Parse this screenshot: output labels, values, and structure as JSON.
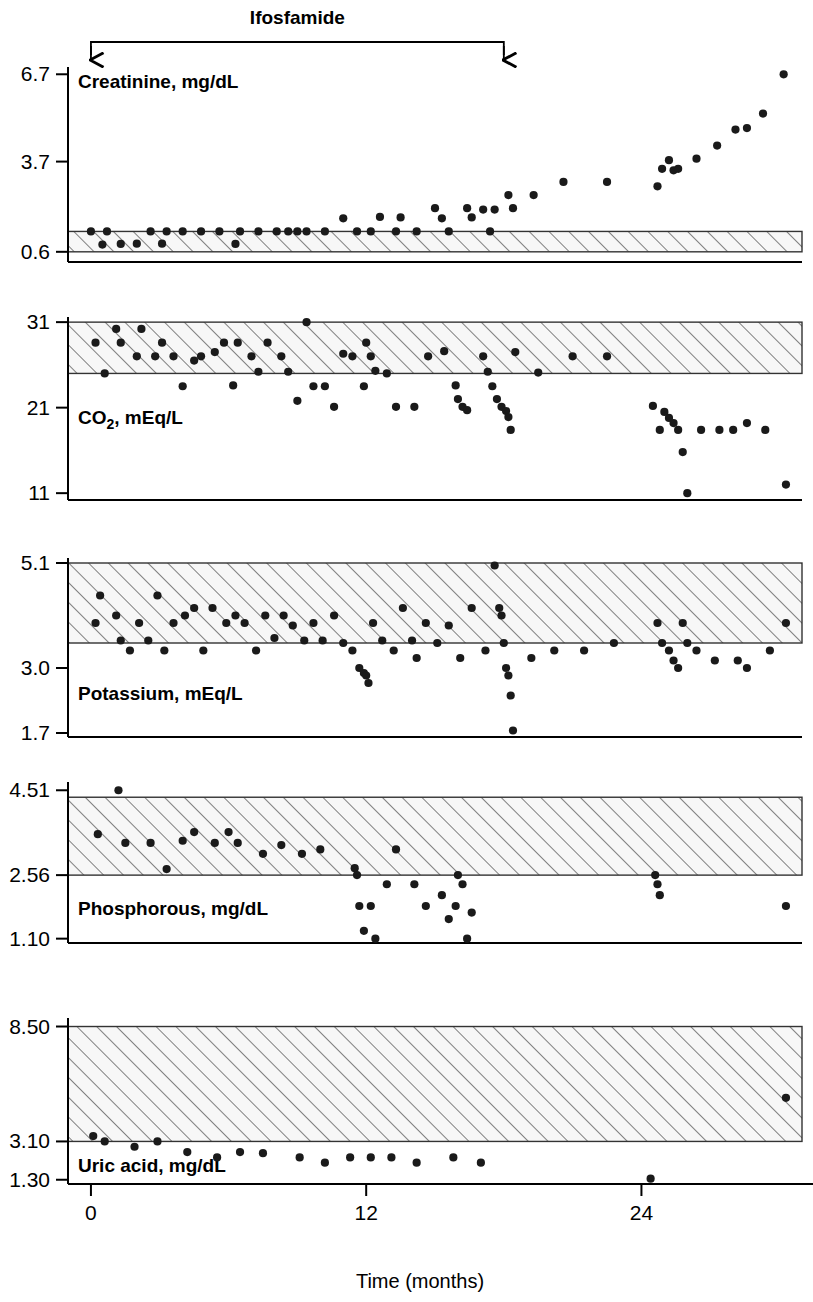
{
  "figure": {
    "title": "",
    "xaxis": {
      "label": "Time (months)",
      "ticks": [
        0,
        12,
        24
      ],
      "tick_labels": [
        "0",
        "12",
        "24"
      ],
      "range": [
        -1,
        31
      ]
    },
    "annotation": {
      "label": "Ifosfamide",
      "start_month": 0,
      "end_month": 18,
      "type": "bracket-with-arrows"
    },
    "marker_color": "#1a1a1a",
    "band_color": "#f2f2f2",
    "hatch_color": "#4d4d4d",
    "axis_color": "#000000"
  },
  "chart_data": [
    {
      "type": "scatter",
      "title": "Creatinine, mg/dL",
      "ylabel": "Creatinine, mg/dL",
      "xlabel": "Time (months)",
      "yticks": [
        0.6,
        3.7,
        6.7
      ],
      "ytick_labels": [
        "0.6",
        "3.7",
        "6.7"
      ],
      "ylim": [
        0.25,
        6.95
      ],
      "reference_band": [
        0.6,
        1.3
      ],
      "grid": false,
      "legend": "none",
      "x": [
        0.0,
        0.5,
        0.7,
        1.3,
        2.0,
        2.6,
        3.1,
        3.3,
        4.0,
        4.8,
        5.6,
        6.3,
        6.5,
        7.3,
        8.1,
        8.6,
        9.0,
        9.4,
        10.2,
        11.0,
        11.6,
        12.2,
        12.6,
        13.3,
        13.5,
        14.2,
        15.0,
        15.3,
        15.6,
        16.4,
        16.6,
        17.1,
        17.4,
        17.6,
        18.2,
        18.4,
        19.3,
        20.6,
        22.5,
        24.7,
        24.9,
        25.2,
        25.4,
        25.6,
        26.4,
        27.3,
        28.1,
        28.6,
        29.3,
        30.2
      ],
      "y": [
        1.3,
        0.85,
        1.3,
        0.87,
        0.88,
        1.3,
        0.88,
        1.3,
        1.3,
        1.3,
        1.3,
        0.87,
        1.3,
        1.3,
        1.3,
        1.3,
        1.3,
        1.3,
        1.3,
        1.75,
        1.3,
        1.3,
        1.8,
        1.3,
        1.78,
        1.3,
        2.1,
        1.75,
        1.3,
        2.1,
        1.78,
        2.05,
        1.3,
        2.05,
        2.55,
        2.1,
        2.55,
        3.0,
        3.0,
        2.85,
        3.45,
        3.75,
        3.4,
        3.45,
        3.8,
        4.25,
        4.8,
        4.85,
        5.35,
        6.7
      ]
    },
    {
      "type": "scatter",
      "title": "CO2, mEq/L",
      "ylabel": "CO2, mEq/L",
      "xlabel": "Time (months)",
      "yticks": [
        11,
        21,
        31
      ],
      "ytick_labels": [
        "11",
        "21",
        "31"
      ],
      "ylim": [
        10.2,
        31.6
      ],
      "reference_band": [
        25,
        31
      ],
      "grid": false,
      "legend": "none",
      "x": [
        0.2,
        0.6,
        1.1,
        1.3,
        2.0,
        2.2,
        2.8,
        3.1,
        3.6,
        4.0,
        4.5,
        4.8,
        5.4,
        5.8,
        6.2,
        6.4,
        7.0,
        7.3,
        7.7,
        8.3,
        8.6,
        9.0,
        9.4,
        9.7,
        10.2,
        10.6,
        11.0,
        11.4,
        11.9,
        12.0,
        12.2,
        12.4,
        12.9,
        13.3,
        14.1,
        14.7,
        15.4,
        15.9,
        16.0,
        16.2,
        16.4,
        17.1,
        17.3,
        17.5,
        17.7,
        17.9,
        18.1,
        18.2,
        18.3,
        18.5,
        19.5,
        21.0,
        22.5,
        24.5,
        24.8,
        25.0,
        25.2,
        25.4,
        25.6,
        25.8,
        26.0,
        26.6,
        27.4,
        28.0,
        28.6,
        29.4,
        30.3
      ],
      "y": [
        28.6,
        25.0,
        30.2,
        28.6,
        27.0,
        30.2,
        27.0,
        28.6,
        27.0,
        23.5,
        26.5,
        27.0,
        27.5,
        28.6,
        23.6,
        28.6,
        27.0,
        25.2,
        28.6,
        27.0,
        25.2,
        21.8,
        31.0,
        23.5,
        23.5,
        21.1,
        27.3,
        27.0,
        23.5,
        28.6,
        27.0,
        25.3,
        25.0,
        21.1,
        21.1,
        27.0,
        27.6,
        23.6,
        22.0,
        21.1,
        20.7,
        27.0,
        25.2,
        23.5,
        22.0,
        21.1,
        20.6,
        19.9,
        18.4,
        27.5,
        25.1,
        27.0,
        27.0,
        21.2,
        18.4,
        20.5,
        19.8,
        19.2,
        18.4,
        15.8,
        11.0,
        18.4,
        18.4,
        18.4,
        19.2,
        18.4,
        12.0
      ]
    },
    {
      "type": "scatter",
      "title": "Potassium, mEq/L",
      "ylabel": "Potassium, mEq/L",
      "xlabel": "Time (months)",
      "yticks": [
        1.7,
        3.0,
        5.1
      ],
      "ytick_labels": [
        "1.7",
        "3.0",
        "5.1"
      ],
      "ylim": [
        1.62,
        5.2
      ],
      "reference_band": [
        3.5,
        5.1
      ],
      "grid": false,
      "legend": "none",
      "x": [
        0.2,
        0.4,
        1.1,
        1.3,
        1.7,
        2.1,
        2.5,
        2.9,
        3.2,
        3.6,
        4.1,
        4.5,
        4.9,
        5.3,
        5.9,
        6.3,
        6.7,
        7.2,
        7.6,
        8.0,
        8.4,
        8.8,
        9.3,
        9.7,
        10.1,
        10.6,
        11.0,
        11.4,
        11.7,
        11.9,
        12.0,
        12.1,
        12.3,
        12.7,
        13.2,
        13.6,
        14.0,
        14.2,
        14.6,
        15.1,
        15.6,
        16.1,
        16.6,
        17.2,
        17.6,
        17.8,
        17.9,
        18.0,
        18.1,
        18.2,
        18.3,
        18.4,
        19.2,
        20.2,
        21.5,
        22.8,
        24.7,
        24.9,
        25.2,
        25.4,
        25.6,
        25.8,
        26.0,
        26.4,
        27.2,
        28.2,
        28.6,
        29.6,
        30.3
      ],
      "y": [
        3.9,
        4.45,
        4.05,
        3.55,
        3.35,
        3.9,
        3.55,
        4.45,
        3.35,
        3.9,
        4.05,
        4.2,
        3.35,
        4.2,
        3.9,
        4.05,
        3.9,
        3.35,
        4.05,
        3.6,
        4.05,
        3.85,
        3.55,
        3.9,
        3.55,
        4.05,
        3.5,
        3.35,
        3.0,
        2.9,
        2.85,
        2.7,
        3.9,
        3.55,
        3.35,
        4.2,
        3.55,
        3.2,
        3.9,
        3.5,
        3.85,
        3.2,
        4.2,
        3.35,
        5.05,
        4.2,
        4.05,
        3.5,
        3.0,
        2.85,
        2.45,
        1.75,
        3.2,
        3.35,
        3.35,
        3.5,
        3.9,
        3.5,
        3.35,
        3.15,
        3.0,
        3.9,
        3.5,
        3.35,
        3.15,
        3.15,
        3.0,
        3.35,
        3.9
      ]
    },
    {
      "type": "scatter",
      "title": "Phosphorous, mg/dL",
      "ylabel": "Phosphorous, mg/dL",
      "xlabel": "Time (months)",
      "yticks": [
        1.1,
        2.56,
        4.51
      ],
      "ytick_labels": [
        "1.10",
        "2.56",
        "4.51"
      ],
      "ylim": [
        1.0,
        4.7
      ],
      "reference_band": [
        2.56,
        4.35
      ],
      "grid": false,
      "legend": "none",
      "x": [
        0.3,
        1.2,
        1.5,
        2.6,
        3.3,
        4.0,
        4.5,
        5.4,
        6.0,
        6.4,
        7.5,
        8.3,
        9.2,
        10.0,
        11.5,
        11.6,
        11.7,
        11.9,
        12.2,
        12.4,
        12.9,
        13.3,
        14.1,
        14.6,
        15.3,
        15.6,
        15.9,
        16.0,
        16.2,
        16.4,
        16.6,
        24.6,
        24.7,
        24.8,
        30.3
      ],
      "y": [
        3.5,
        4.51,
        3.3,
        3.3,
        2.7,
        3.35,
        3.55,
        3.3,
        3.55,
        3.3,
        3.05,
        3.25,
        3.05,
        3.15,
        2.72,
        2.56,
        1.85,
        1.28,
        1.85,
        1.1,
        2.35,
        3.15,
        2.35,
        1.85,
        2.1,
        1.55,
        1.85,
        2.56,
        2.35,
        1.1,
        1.7,
        2.56,
        2.35,
        2.1,
        1.85,
        3.9
      ]
    },
    {
      "type": "scatter",
      "title": "Uric acid, mg/dL",
      "ylabel": "Uric acid, mg/dL",
      "xlabel": "Time (months)",
      "yticks": [
        1.3,
        3.1,
        8.5
      ],
      "ytick_labels": [
        "1.30",
        "3.10",
        "8.50"
      ],
      "ylim": [
        1.1,
        8.9
      ],
      "reference_band": [
        3.1,
        8.5
      ],
      "grid": false,
      "legend": "none",
      "x": [
        0.1,
        0.6,
        1.9,
        2.9,
        4.2,
        5.5,
        6.5,
        7.5,
        9.1,
        10.2,
        11.3,
        12.2,
        13.1,
        14.2,
        15.8,
        17.0,
        24.4,
        30.3
      ],
      "y": [
        3.35,
        3.1,
        2.85,
        3.1,
        2.6,
        2.35,
        2.6,
        2.55,
        2.35,
        2.1,
        2.35,
        2.35,
        2.35,
        2.1,
        2.35,
        2.1,
        1.35,
        5.15
      ]
    }
  ],
  "panels": [
    {
      "name": "creatinine",
      "label": "Creatinine, mg/dL"
    },
    {
      "name": "co2",
      "label_main": "CO",
      "label_sub": "2",
      "label_rest": ", mEq/L",
      "label": "CO2, mEq/L"
    },
    {
      "name": "potassium",
      "label": "Potassium, mEq/L"
    },
    {
      "name": "phosphorous",
      "label": "Phosphorous, mg/dL"
    },
    {
      "name": "uric-acid",
      "label": "Uric acid, mg/dL"
    }
  ]
}
